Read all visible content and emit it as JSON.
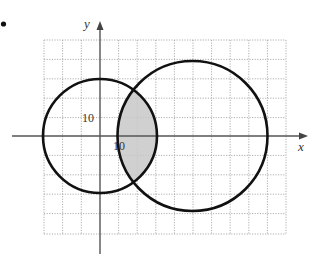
{
  "figure": {
    "bullet": "•",
    "axes": {
      "x_label": "x",
      "y_label": "y",
      "x_tick_label": "10",
      "y_tick_label": "10",
      "grid_unit": 10,
      "x_range_cells": [
        -3,
        10
      ],
      "y_range_cells": [
        -5,
        5
      ]
    },
    "circles": [
      {
        "name": "circle-1",
        "center": [
          0,
          0
        ],
        "radius": 30
      },
      {
        "name": "circle-2",
        "center": [
          50,
          0
        ],
        "radius": 40
      }
    ],
    "shaded_region": "intersection of circle-1 and circle-2",
    "colors": {
      "grid": "#9a9a9a",
      "axis": "#555555",
      "circle": "#111111",
      "shade": "#c8c8c8"
    }
  }
}
